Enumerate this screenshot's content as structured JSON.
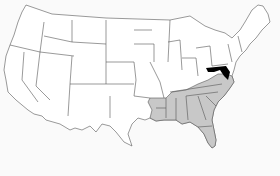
{
  "map": {
    "title": "United States map",
    "colors": {
      "background": "#fafafa",
      "default_fill": "#ffffff",
      "shaded_fill": "#c8c8c8",
      "highlight_fill": "#000000",
      "border": "#555555"
    },
    "highlighted_states": [
      "Maryland",
      "Delaware"
    ],
    "shaded_states": [
      "Arkansas",
      "Louisiana",
      "Mississippi",
      "Alabama",
      "Georgia",
      "Florida",
      "Tennessee",
      "Kentucky",
      "West Virginia",
      "Virginia",
      "North Carolina",
      "South Carolina"
    ]
  }
}
